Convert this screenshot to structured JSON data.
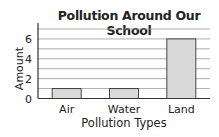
{
  "chart_data": {
    "type": "bar",
    "title": "Pollution Around Our School",
    "xlabel": "Pollution Types",
    "ylabel": "Amount",
    "categories": [
      "Air",
      "Water",
      "Land"
    ],
    "values": [
      1,
      1,
      6
    ],
    "ylim": [
      0,
      7
    ],
    "yticks": [
      0,
      2,
      4,
      6
    ],
    "grid": true,
    "bar_color": "#d9d9d9",
    "bar_edge_color": "#333333",
    "grid_color": "#999999"
  }
}
